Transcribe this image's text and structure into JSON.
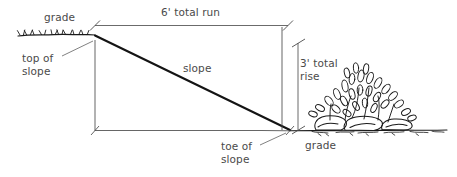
{
  "diagram": {
    "stroke_color": "#1a1a1a",
    "dimension_color": "#555555",
    "text_color": "#4a4a4a",
    "background_color": "#ffffff",
    "labels": {
      "grade_top": "grade",
      "total_run": "6' total run",
      "top_of_slope": "top of\nslope",
      "slope": "slope",
      "total_rise": "3' total\nrise",
      "toe_of_slope": "toe of\nslope",
      "grade_bottom": "grade"
    },
    "measurements": {
      "run": "6'",
      "rise": "3'",
      "run_description": "total run",
      "rise_description": "total rise"
    },
    "elements": [
      "upper-grade-line",
      "slope-line",
      "lower-grade-line",
      "run-dimension-line",
      "rise-dimension-line",
      "top-of-slope-extension-line",
      "toe-of-slope-extension-line",
      "leader-top-of-slope",
      "leader-toe-of-slope",
      "rocks-and-vegetation"
    ]
  }
}
